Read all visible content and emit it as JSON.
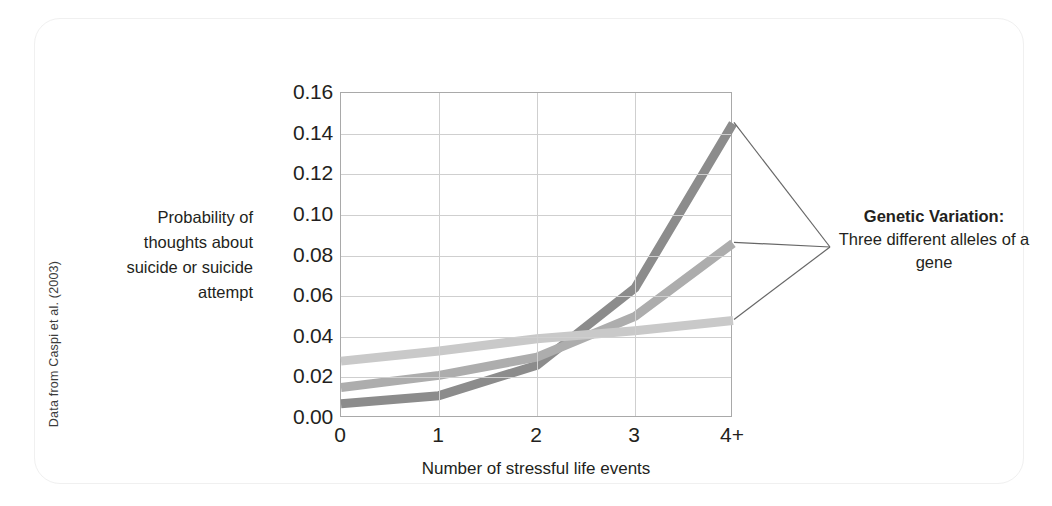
{
  "figure": {
    "source_credit": "Data from Caspi et al. (2003)"
  },
  "callout": {
    "heading": "Genetic Variation:",
    "body": "Three different alleles of a gene"
  },
  "chart_data": {
    "type": "line",
    "title": "",
    "xlabel": "Number of stressful life events",
    "ylabel": "Probability of thoughts about suicide or suicide attempt",
    "categories": [
      "0",
      "1",
      "2",
      "3",
      "4+"
    ],
    "xtick_labels": [
      "0",
      "1",
      "2",
      "3",
      "4+"
    ],
    "ytick_labels": [
      "0.16",
      "0.14",
      "0.12",
      "0.10",
      "0.08",
      "0.06",
      "0.04",
      "0.02",
      "0.00"
    ],
    "ytick_values": [
      0.16,
      0.14,
      0.12,
      0.1,
      0.08,
      0.06,
      0.04,
      0.02,
      0.0
    ],
    "ylim": [
      0.0,
      0.16
    ],
    "grid": "horizontal-and-vertical",
    "legend": "callout-annotation",
    "series": [
      {
        "name": "allele-dark",
        "color": "#8c8c8c",
        "values": [
          0.007,
          0.011,
          0.026,
          0.064,
          0.145
        ]
      },
      {
        "name": "allele-medium",
        "color": "#adadad",
        "values": [
          0.015,
          0.021,
          0.03,
          0.05,
          0.086
        ]
      },
      {
        "name": "allele-light",
        "color": "#c9c9c9",
        "values": [
          0.028,
          0.033,
          0.039,
          0.043,
          0.048
        ]
      }
    ]
  }
}
